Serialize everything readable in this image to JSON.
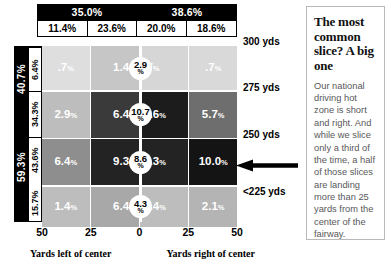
{
  "chart_data": {
    "type": "heatmap",
    "xlabel_left": "Yards left of center",
    "xlabel_right": "Yards right of center",
    "x_ticks": [
      "50",
      "25",
      "0",
      "25",
      "50"
    ],
    "columns": [
      "11.4%",
      "23.6%",
      "20.0%",
      "18.6%"
    ],
    "column_groups": [
      {
        "label": "35.0%",
        "span": 2
      },
      {
        "label": "38.6%",
        "span": 2
      }
    ],
    "rows": [
      {
        "distance": "300 yds",
        "row_pct": "6.4%",
        "center": "2.9",
        "values": [
          ".7",
          "1.4",
          ".7",
          ".7"
        ]
      },
      {
        "distance": "275 yds",
        "row_pct": "34.3%",
        "center": "10.7",
        "values": [
          "2.9",
          "6.4",
          "8.6",
          "5.7"
        ]
      },
      {
        "distance": "250 yds",
        "row_pct": "43.6%",
        "center": "8.6",
        "values": [
          "6.4",
          "9.3",
          "9.3",
          "10.0"
        ]
      },
      {
        "distance": "<225 yds",
        "row_pct": "15.7%",
        "center": "4.3",
        "values": [
          "1.4",
          "6.4",
          "1.4",
          "2.1"
        ]
      }
    ],
    "row_groups": [
      {
        "label": "40.7%",
        "span": 2
      },
      {
        "label": "59.3%",
        "span": 2
      }
    ],
    "percent_symbol": "%",
    "cell_shades": [
      [
        "#dedede",
        "#c6c6c6",
        "#d6d6d6",
        "#d9d9d9"
      ],
      [
        "#bdbdbd",
        "#3a3a3a",
        "#1c1c1c",
        "#6e6e6e"
      ],
      [
        "#8e8e8e",
        "#232323",
        "#232323",
        "#141414"
      ],
      [
        "#bdbdbd",
        "#a8a8a8",
        "#bdbdbd",
        "#b4b4b4"
      ]
    ],
    "grid": false,
    "legend": "none",
    "annotation": {
      "name": "arrow-to-max-cell",
      "target_value": "10.0",
      "direction": "left"
    }
  },
  "header": {
    "group_left": "35.0%",
    "group_right": "38.6%"
  },
  "sidebar_totals": {
    "top": "40.7%",
    "bottom": "59.3%"
  },
  "panel": {
    "headline": "The most common slice? A big one",
    "body": "Our national driving hot zone is short and right. And while we slice only a third of the time, a half of those slices are landing more than 25 yards from the center of the fairway."
  },
  "icons": {
    "arrow": "left-arrow-icon"
  }
}
